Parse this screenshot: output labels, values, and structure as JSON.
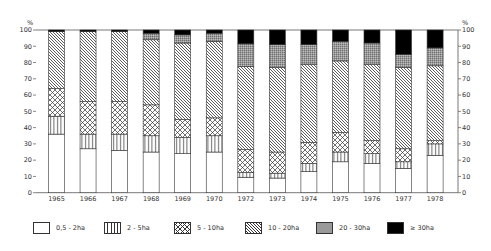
{
  "chart_data": {
    "type": "bar",
    "stacked": true,
    "title": "",
    "xlabel": "",
    "ylabel": "%",
    "ylabel_right": "%",
    "ylim": [
      0,
      100
    ],
    "yticks": [
      0,
      10,
      20,
      30,
      40,
      50,
      60,
      70,
      80,
      90,
      100
    ],
    "grid": false,
    "legend_position": "bottom",
    "categories": [
      "1965",
      "1966",
      "1967",
      "1968",
      "1969",
      "1970",
      "1972",
      "1973",
      "1974",
      "1975",
      "1976",
      "1977",
      "1978"
    ],
    "series": [
      {
        "name": "0,5 - 2ha",
        "pattern": "blank",
        "values": [
          36,
          27,
          26,
          25,
          24,
          25,
          9.5,
          9,
          13,
          19,
          18,
          15,
          23
        ]
      },
      {
        "name": "2 - 5ha",
        "pattern": "vertical-lines",
        "values": [
          11,
          9,
          10,
          10,
          10,
          10,
          3,
          3,
          5,
          6,
          6,
          4,
          7
        ]
      },
      {
        "name": "5 - 10ha",
        "pattern": "crosshatch",
        "values": [
          17,
          20,
          20,
          19,
          11,
          11,
          14,
          13,
          13,
          12,
          8,
          8,
          2
        ]
      },
      {
        "name": "10 - 20ha",
        "pattern": "diagonal-lines",
        "values": [
          35,
          43,
          43,
          40,
          47,
          47,
          51,
          52,
          48,
          44,
          47,
          50,
          46
        ]
      },
      {
        "name": "20 - 30ha",
        "pattern": "grey-stipple",
        "values": [
          0,
          0,
          0,
          4,
          5,
          5,
          14,
          14,
          12,
          12,
          13,
          8,
          11
        ]
      },
      {
        "name": "≥ 30ha",
        "pattern": "solid-black",
        "values": [
          1,
          1,
          1,
          2,
          3,
          2,
          8.5,
          9,
          9,
          7,
          8,
          15,
          11
        ]
      }
    ]
  },
  "axis": {
    "unit_left": "%",
    "unit_right": "%"
  },
  "legend": [
    {
      "label": "0,5 - 2ha"
    },
    {
      "label": "2 - 5ha"
    },
    {
      "label": "5 - 10ha"
    },
    {
      "label": "10 - 20ha"
    },
    {
      "label": "20 - 30ha"
    },
    {
      "label": "≥ 30ha"
    }
  ]
}
